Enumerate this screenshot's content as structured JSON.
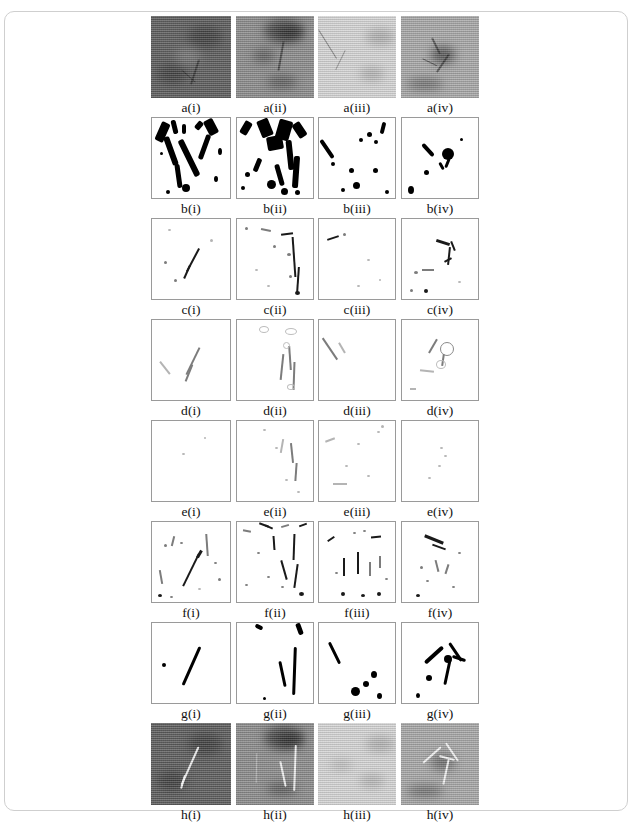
{
  "figure": {
    "rows": [
      {
        "key": "a",
        "kind": "photo",
        "panels": [
          {
            "label": "a(i)",
            "tone": "#5e5e5e",
            "name": "panel-a-i"
          },
          {
            "label": "a(ii)",
            "tone": "#8d8d8d",
            "name": "panel-a-ii"
          },
          {
            "label": "a(iii)",
            "tone": "#d6d6d6",
            "name": "panel-a-iii"
          },
          {
            "label": "a(iv)",
            "tone": "#a9a9a9",
            "name": "panel-a-iv"
          }
        ]
      },
      {
        "key": "b",
        "kind": "binary",
        "panels": [
          {
            "label": "b(i)",
            "name": "panel-b-i"
          },
          {
            "label": "b(ii)",
            "name": "panel-b-ii"
          },
          {
            "label": "b(iii)",
            "name": "panel-b-iii"
          },
          {
            "label": "b(iv)",
            "name": "panel-b-iv"
          }
        ]
      },
      {
        "key": "c",
        "kind": "edges",
        "panels": [
          {
            "label": "c(i)",
            "name": "panel-c-i"
          },
          {
            "label": "c(ii)",
            "name": "panel-c-ii"
          },
          {
            "label": "c(iii)",
            "name": "panel-c-iii"
          },
          {
            "label": "c(iv)",
            "name": "panel-c-iv"
          }
        ]
      },
      {
        "key": "d",
        "kind": "edges",
        "panels": [
          {
            "label": "d(i)",
            "name": "panel-d-i"
          },
          {
            "label": "d(ii)",
            "name": "panel-d-ii"
          },
          {
            "label": "d(iii)",
            "name": "panel-d-iii"
          },
          {
            "label": "d(iv)",
            "name": "panel-d-iv"
          }
        ]
      },
      {
        "key": "e",
        "kind": "edges",
        "panels": [
          {
            "label": "e(i)",
            "name": "panel-e-i"
          },
          {
            "label": "e(ii)",
            "name": "panel-e-ii"
          },
          {
            "label": "e(iii)",
            "name": "panel-e-iii"
          },
          {
            "label": "e(iv)",
            "name": "panel-e-iv"
          }
        ]
      },
      {
        "key": "f",
        "kind": "edges",
        "panels": [
          {
            "label": "f(i)",
            "name": "panel-f-i"
          },
          {
            "label": "f(ii)",
            "name": "panel-f-ii"
          },
          {
            "label": "f(iii)",
            "name": "panel-f-iii"
          },
          {
            "label": "f(iv)",
            "name": "panel-f-iv"
          }
        ]
      },
      {
        "key": "g",
        "kind": "binary",
        "panels": [
          {
            "label": "g(i)",
            "name": "panel-g-i"
          },
          {
            "label": "g(ii)",
            "name": "panel-g-ii"
          },
          {
            "label": "g(iii)",
            "name": "panel-g-iii"
          },
          {
            "label": "g(iv)",
            "name": "panel-g-iv"
          }
        ]
      },
      {
        "key": "h",
        "kind": "photo-overlay",
        "panels": [
          {
            "label": "h(i)",
            "tone": "#5e5e5e",
            "name": "panel-h-i"
          },
          {
            "label": "h(ii)",
            "tone": "#8d8d8d",
            "name": "panel-h-ii"
          },
          {
            "label": "h(iii)",
            "tone": "#d6d6d6",
            "name": "panel-h-iii"
          },
          {
            "label": "h(iv)",
            "tone": "#a9a9a9",
            "name": "panel-h-iv"
          }
        ]
      }
    ],
    "colors": {
      "frame_border": "#cfcfcf",
      "panel_border": "#9a9a9a",
      "ink": "#000000",
      "page_background": "#ffffff"
    }
  }
}
